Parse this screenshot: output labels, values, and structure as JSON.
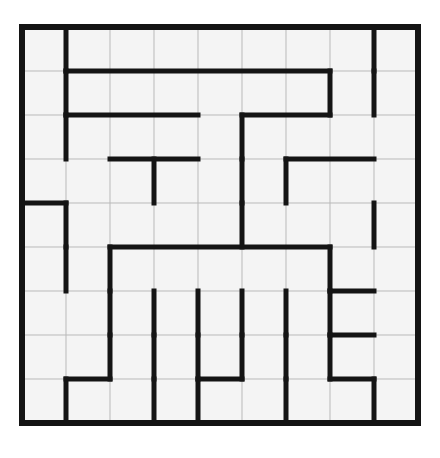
{
  "puzzle": {
    "title": "Maze Grid Puzzle",
    "type": "maze",
    "rows": 9,
    "cols": 9,
    "cell_size": 44,
    "origin_x": 22,
    "origin_y": 27,
    "colors": {
      "background": "#ffffff",
      "cell_fill": "#f4f4f4",
      "grid_line": "#b9b9b9",
      "wall": "#141414"
    },
    "line_widths": {
      "grid_line": 1,
      "wall": 5,
      "border": 6
    },
    "border": {
      "top": true,
      "right": true,
      "bottom": true,
      "left": true
    },
    "h_walls": [
      [
        0,
        0,
        0,
        0,
        0,
        0,
        0,
        0,
        0
      ],
      [
        0,
        1,
        1,
        1,
        1,
        1,
        1,
        0,
        0
      ],
      [
        0,
        1,
        1,
        1,
        0,
        1,
        1,
        0,
        0
      ],
      [
        0,
        0,
        1,
        1,
        0,
        0,
        1,
        1,
        0
      ],
      [
        1,
        0,
        0,
        0,
        0,
        0,
        0,
        0,
        0
      ],
      [
        0,
        0,
        1,
        1,
        1,
        1,
        1,
        0,
        0
      ],
      [
        0,
        0,
        0,
        0,
        0,
        0,
        0,
        1,
        0
      ],
      [
        0,
        0,
        0,
        0,
        0,
        0,
        0,
        1,
        0
      ],
      [
        0,
        1,
        0,
        0,
        1,
        0,
        0,
        1,
        0
      ],
      [
        0,
        0,
        0,
        0,
        0,
        0,
        0,
        0,
        0
      ]
    ],
    "v_walls": [
      [
        0,
        1,
        0,
        0,
        0,
        0,
        0,
        0,
        1,
        0
      ],
      [
        0,
        1,
        0,
        0,
        0,
        0,
        0,
        1,
        1,
        0
      ],
      [
        0,
        1,
        0,
        0,
        0,
        1,
        0,
        0,
        0,
        0
      ],
      [
        0,
        0,
        0,
        1,
        0,
        1,
        1,
        0,
        0,
        0
      ],
      [
        0,
        1,
        0,
        0,
        0,
        1,
        0,
        0,
        1,
        0
      ],
      [
        0,
        1,
        1,
        0,
        0,
        0,
        0,
        1,
        0,
        0
      ],
      [
        0,
        0,
        1,
        1,
        1,
        1,
        1,
        1,
        0,
        0
      ],
      [
        0,
        0,
        1,
        1,
        1,
        1,
        1,
        1,
        0,
        0
      ],
      [
        0,
        1,
        0,
        1,
        1,
        0,
        1,
        0,
        1,
        0
      ]
    ]
  }
}
